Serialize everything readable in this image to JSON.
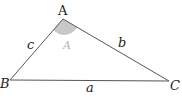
{
  "diagram": {
    "type": "triangle",
    "vertices": {
      "A": {
        "label": "A",
        "x": 63,
        "y": 19
      },
      "B": {
        "label": "B",
        "x": 10,
        "y": 80
      },
      "C": {
        "label": "C",
        "x": 169,
        "y": 81
      }
    },
    "sides": {
      "a": {
        "label": "a",
        "between": [
          "B",
          "C"
        ]
      },
      "b": {
        "label": "b",
        "between": [
          "A",
          "C"
        ]
      },
      "c": {
        "label": "c",
        "between": [
          "A",
          "B"
        ]
      }
    },
    "angle": {
      "label": "A",
      "at": "A",
      "shaded": true,
      "color": "#c8c8c8"
    },
    "colors": {
      "stroke": "#555555",
      "text": "#222222",
      "angle_label": "#b5b5b5"
    }
  }
}
